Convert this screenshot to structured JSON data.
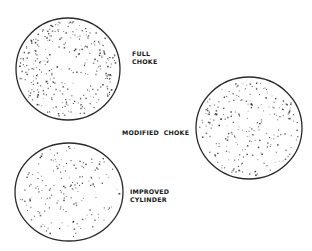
{
  "figure": {
    "background": "#ffffff",
    "ink_color": "#2a2a2a",
    "patterns": [
      {
        "id": "full-choke",
        "label_lines": [
          "FULL",
          "CHOKE"
        ],
        "center": [
          68,
          69
        ],
        "radius_x": 52,
        "radius_y": 51,
        "dot_count": 300,
        "concentration": 0.7,
        "seed": 11,
        "label_pos": [
          132,
          50
        ]
      },
      {
        "id": "modified-choke",
        "label_lines": [
          "MODIFIED  CHOKE"
        ],
        "center": [
          249,
          128
        ],
        "radius_x": 53,
        "radius_y": 51,
        "dot_count": 230,
        "concentration": 0.85,
        "seed": 29,
        "label_pos": [
          122,
          129
        ]
      },
      {
        "id": "improved-cylinder",
        "label_lines": [
          "IMPROVED",
          "CYLINDER"
        ],
        "center": [
          69,
          192
        ],
        "radius_x": 54,
        "radius_y": 49,
        "dot_count": 165,
        "concentration": 1.0,
        "seed": 47,
        "label_pos": [
          130,
          188
        ]
      }
    ]
  }
}
